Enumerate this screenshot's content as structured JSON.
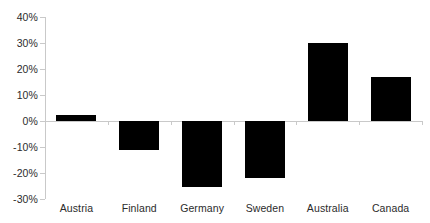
{
  "chart_data": {
    "type": "bar",
    "title": "",
    "subtitle": "",
    "xlabel": "",
    "ylabel": "",
    "categories": [
      "Austria",
      "Finland",
      "Germany",
      "Sweden",
      "Australia",
      "Canada"
    ],
    "values": [
      2.5,
      -11,
      -25.5,
      -22,
      30,
      17
    ],
    "value_labels": [
      "2.5%",
      "-11%",
      "-25.5%",
      "-22%",
      "30%",
      "17%"
    ],
    "series": [
      {
        "name": "",
        "values": [
          2.5,
          -11,
          -25.5,
          -22,
          30,
          17
        ]
      }
    ],
    "ylim": [
      -30,
      40
    ],
    "ytick_values": [
      40,
      30,
      20,
      10,
      0,
      -10,
      -20,
      -30
    ],
    "ytick_labels": [
      "40%",
      "30%",
      "20%",
      "10%",
      "0%",
      "-10%",
      "-20%",
      "-30%"
    ],
    "grid": false,
    "legend": false,
    "legend_position": "none",
    "bar_color": "#000000",
    "axis_color": "#c9c9c9",
    "text_color": "#2b2b2b",
    "background_color": "#ffffff",
    "annotations": []
  }
}
